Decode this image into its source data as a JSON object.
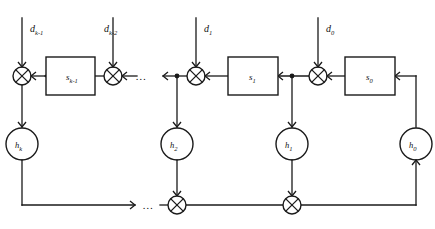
{
  "figure": {
    "name": "linear-feedback-shift-register-diagram",
    "type": "block-diagram",
    "background_color": "#ffffff",
    "line_color": "#1a1a1a",
    "width": 435,
    "height": 229
  },
  "inputs": [
    {
      "id": "d-k-1",
      "base": "d",
      "sub": "k-1",
      "x": 22
    },
    {
      "id": "d-k-2",
      "base": "d",
      "sub": "k-2",
      "x": 104
    },
    {
      "id": "d-1",
      "base": "d",
      "sub": "1",
      "x": 196
    },
    {
      "id": "d-0",
      "base": "d",
      "sub": "0",
      "x": 318
    }
  ],
  "boxes": [
    {
      "id": "s-k-1",
      "base": "s",
      "sub": "k-1"
    },
    {
      "id": "s-1",
      "base": "s",
      "sub": "1"
    },
    {
      "id": "s-0",
      "base": "s",
      "sub": "0"
    }
  ],
  "circles": [
    {
      "id": "h-k",
      "base": "h",
      "sub": "k"
    },
    {
      "id": "h-2",
      "base": "h",
      "sub": "2"
    },
    {
      "id": "h-1",
      "base": "h",
      "sub": "1"
    },
    {
      "id": "h-0",
      "base": "h",
      "sub": "0"
    }
  ],
  "ellipses": [
    {
      "id": "top-ellipsis",
      "text": "…"
    },
    {
      "id": "bottom-ellipsis",
      "text": "…"
    }
  ],
  "adders": {
    "symbol": "xor",
    "top_count": 4,
    "bottom_count": 2
  }
}
